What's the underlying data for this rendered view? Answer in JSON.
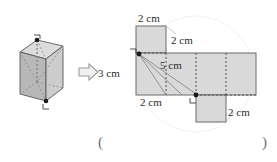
{
  "figure": {
    "solid": {
      "name": "rectangular-prism",
      "shading": "#c9c9c9",
      "edge_color": "#5a5a5a",
      "hidden_edge_style": "dashed",
      "corner_markers": [
        {
          "name": "top-right-angle-mark",
          "symbol": "right-angle"
        },
        {
          "name": "bottom-right-angle-mark",
          "symbol": "right-angle"
        }
      ]
    },
    "arrow": {
      "name": "implies-arrow",
      "glyph": "⇨",
      "color": "#9a9a9a"
    },
    "net": {
      "fill": "#d9d9d9",
      "outline_color": "#6b6b6b",
      "fold_line_style": "dotted",
      "faces": [
        {
          "name": "net-face-top",
          "width_cm": 2,
          "height_cm": 2
        },
        {
          "name": "net-face-left",
          "width_cm": 2,
          "height_cm": 3
        },
        {
          "name": "net-face-front",
          "width_cm": 2,
          "height_cm": 3
        },
        {
          "name": "net-face-right",
          "width_cm": 2,
          "height_cm": 3
        },
        {
          "name": "net-face-back",
          "width_cm": 2,
          "height_cm": 3
        },
        {
          "name": "net-face-bottom",
          "width_cm": 2,
          "height_cm": 2
        }
      ],
      "diagonals": [
        {
          "name": "diagonal-5cm",
          "length_cm": 5
        },
        {
          "name": "diagonal-helper-a"
        },
        {
          "name": "diagonal-helper-b"
        }
      ],
      "endpoint_dots": 2,
      "right_angle_marks": 2
    }
  },
  "labels": {
    "top_width": "2 cm",
    "top_right_height": "2 cm",
    "diagonal": "5 cm",
    "left_height": "3 cm",
    "bottom_width": "2 cm",
    "lower_right_height": "2 cm"
  },
  "answer_blank": {
    "open_paren": "(",
    "close_paren": ")"
  }
}
